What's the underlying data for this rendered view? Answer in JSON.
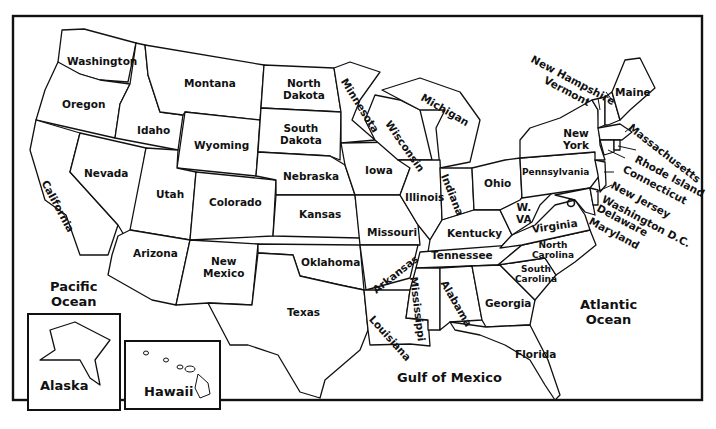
{
  "map": {
    "title": "United States",
    "states": {
      "washington": "Washington",
      "oregon": "Oregon",
      "california": "California",
      "idaho": "Idaho",
      "nevada": "Nevada",
      "montana": "Montana",
      "wyoming": "Wyoming",
      "utah": "Utah",
      "arizona": "Arizona",
      "colorado": "Colorado",
      "new_mexico": [
        "New",
        "Mexico"
      ],
      "north_dakota": [
        "North",
        "Dakota"
      ],
      "south_dakota": [
        "South",
        "Dakota"
      ],
      "nebraska": "Nebraska",
      "kansas": "Kansas",
      "oklahoma": "Oklahoma",
      "texas": "Texas",
      "minnesota": "Minnesota",
      "iowa": "Iowa",
      "missouri": "Missouri",
      "arkansas": "Arkansas",
      "louisiana": "Louisiana",
      "wisconsin": "Wisconsin",
      "michigan": "Michigan",
      "illinois": "Illinois",
      "indiana": "Indiana",
      "ohio": "Ohio",
      "kentucky": "Kentucky",
      "tennessee": "Tennessee",
      "mississippi": "Mississippi",
      "alabama": "Alabama",
      "georgia": "Georgia",
      "florida": "Florida",
      "south_carolina": [
        "South",
        "Carolina"
      ],
      "north_carolina": [
        "North",
        "Carolina"
      ],
      "virginia": "Virginia",
      "west_virginia": [
        "W.",
        "VA"
      ],
      "pennsylvania": "Pennsylvania",
      "new_york": [
        "New",
        "York"
      ],
      "maine": "Maine",
      "new_hampshire": "New Hampshire",
      "vermont": "Vermont",
      "massachusetts": "Massachusetts",
      "rhode_island": "Rhode Island",
      "connecticut": "Connecticut",
      "new_jersey": "New Jersey",
      "washington_dc": "Washington D.C.",
      "delaware": "Delaware",
      "maryland": "Maryland",
      "alaska": "Alaska",
      "hawaii": "Hawaii"
    },
    "water": {
      "pacific": [
        "Pacific",
        "Ocean"
      ],
      "atlantic": [
        "Atlantic",
        "Ocean"
      ],
      "gulf": "Gulf of Mexico"
    },
    "colors": {
      "line": "#111111",
      "background": "#ffffff"
    }
  }
}
